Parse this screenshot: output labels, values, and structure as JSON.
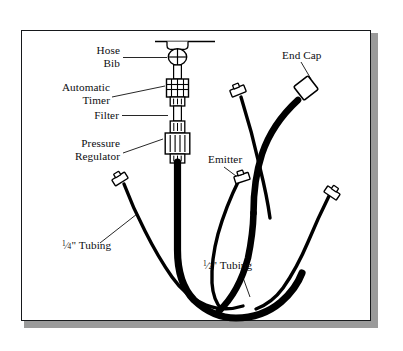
{
  "diagram": {
    "background_color": "#ffffff",
    "line_color": "#000000",
    "frame_color": "#16181b",
    "shadow_color": "#9a9a9a",
    "labels": {
      "hose_bib_line1": "Hose",
      "hose_bib_line2": "Bib",
      "automatic_timer_line1": "Automatic",
      "automatic_timer_line2": "Timer",
      "filter": "Filter",
      "pressure_regulator_line1": "Pressure",
      "pressure_regulator_line2": "Regulator",
      "end_cap": "End Cap",
      "emitter": "Emitter",
      "quarter_tubing_suffix": "\" Tubing",
      "quarter_numerator": "1",
      "quarter_denominator": "4",
      "half_tubing_suffix": "\" Tubing",
      "half_numerator": "1",
      "half_denominator": "2",
      "fraction_slash": "⁄"
    },
    "components": [
      {
        "name": "hose-bib",
        "type": "valve",
        "label": "Hose Bib"
      },
      {
        "name": "automatic-timer",
        "type": "inline-device",
        "label": "Automatic Timer"
      },
      {
        "name": "filter",
        "type": "inline-device",
        "label": "Filter"
      },
      {
        "name": "pressure-regulator",
        "type": "inline-device",
        "label": "Pressure Regulator"
      },
      {
        "name": "end-cap",
        "type": "cap",
        "label": "End Cap"
      },
      {
        "name": "emitter",
        "type": "emitter",
        "label": "Emitter"
      },
      {
        "name": "half-inch-tubing",
        "type": "tubing",
        "label": "1/2\" Tubing"
      },
      {
        "name": "quarter-inch-tubing",
        "type": "tubing",
        "label": "1/4\" Tubing"
      }
    ]
  }
}
